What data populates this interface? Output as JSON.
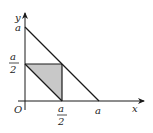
{
  "diagram": {
    "type": "coordinate-geometry",
    "axes": {
      "x_label": "x",
      "y_label": "y",
      "origin_label": "O"
    },
    "ticks": {
      "x_a": "a",
      "y_a": "a",
      "x_half_num": "a",
      "x_half_den": "2",
      "y_half_num": "a",
      "y_half_den": "2"
    },
    "lines": [
      {
        "name": "line-x-plus-y-eq-a",
        "from": [
          0,
          1
        ],
        "to": [
          1,
          0
        ]
      },
      {
        "name": "line-x-plus-y-eq-half-a",
        "from": [
          0,
          0.5
        ],
        "to": [
          0.5,
          0
        ]
      }
    ],
    "shaded_region": {
      "vertices": [
        [
          0,
          0.5
        ],
        [
          0.5,
          0.5
        ],
        [
          0.5,
          0
        ]
      ],
      "fill": "#c8c8c8"
    },
    "colors": {
      "stroke": "#1a1a1a",
      "shade": "#c8c8c8"
    }
  }
}
